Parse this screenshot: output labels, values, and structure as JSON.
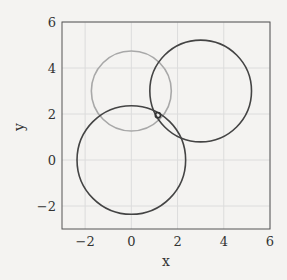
{
  "chart_data": {
    "type": "scatter",
    "title": "",
    "xlabel": "x",
    "ylabel": "y",
    "xlim": [
      -3,
      6
    ],
    "ylim": [
      -3,
      6
    ],
    "xticks": [
      -2,
      0,
      2,
      4,
      6
    ],
    "yticks": [
      -2,
      0,
      2,
      4,
      6
    ],
    "xtick_labels": [
      "−2",
      "0",
      "2",
      "4",
      "6"
    ],
    "ytick_labels": [
      "−2",
      "0",
      "2",
      "4",
      "6"
    ],
    "grid": true,
    "legend": null,
    "circles": [
      {
        "name": "circle-gray",
        "center": [
          0,
          3
        ],
        "radius": 1.73,
        "color": "#a8a8a8"
      },
      {
        "name": "circle-bottom",
        "center": [
          0,
          0
        ],
        "radius": 2.35,
        "color": "#444444"
      },
      {
        "name": "circle-right",
        "center": [
          3,
          3
        ],
        "radius": 2.2,
        "color": "#444444"
      }
    ],
    "points": [
      {
        "name": "intersection-marker",
        "x": 1.15,
        "y": 1.95,
        "color": "#333333",
        "marker": "open-circle"
      }
    ]
  },
  "colors": {
    "background": "#f4f3f1",
    "grid": "#dcdcdc",
    "axes": "#555555"
  }
}
